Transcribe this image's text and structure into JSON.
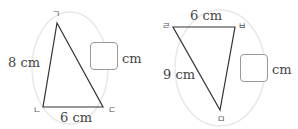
{
  "triangle1": {
    "vertices": {
      "top": "ㄱ",
      "bottom_left": "ㄴ",
      "bottom_right": "ㄷ"
    },
    "side_left": "8 cm",
    "side_bottom": "6 cm",
    "answer_unit": "cm",
    "answer_value": ""
  },
  "triangle2": {
    "vertices": {
      "top_left": "ㄹ",
      "top_right": "ㅂ",
      "bottom": "ㅁ"
    },
    "side_top": "6 cm",
    "side_left": "9 cm",
    "answer_unit": "cm",
    "answer_value": ""
  },
  "colors": {
    "line": "#333333",
    "circle": "#e6e6e6",
    "box_border": "#999999"
  }
}
